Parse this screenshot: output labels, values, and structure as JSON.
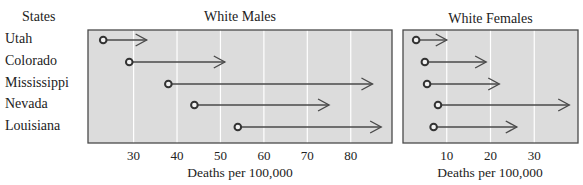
{
  "states_header": "States",
  "states": [
    "Utah",
    "Colorado",
    "Mississippi",
    "Nevada",
    "Louisiana"
  ],
  "colors": {
    "panel_fill": "#dcdcdc",
    "panel_border": "#4a4a4a",
    "gridline": "#ffffff",
    "arrow": "#4a4a4a",
    "marker": "#333333"
  },
  "chart_data": [
    {
      "type": "arrow-dot",
      "title": "White Males",
      "xlabel": "Deaths per 100,000",
      "ylabel": "States",
      "xticks": [
        30,
        40,
        50,
        60,
        70,
        80
      ],
      "xlim": [
        19.5,
        89.5
      ],
      "grid": true,
      "categories": [
        "Utah",
        "Colorado",
        "Mississippi",
        "Nevada",
        "Louisiana"
      ],
      "series": [
        {
          "name": "start",
          "values": [
            23,
            29,
            38,
            44,
            54
          ]
        },
        {
          "name": "end",
          "values": [
            33,
            51,
            85,
            75,
            87
          ]
        }
      ]
    },
    {
      "type": "arrow-dot",
      "title": "White Females",
      "xlabel": "Deaths per 100,000",
      "ylabel": "States",
      "xticks": [
        10,
        20,
        30
      ],
      "xlim": [
        0,
        40
      ],
      "grid": true,
      "categories": [
        "Utah",
        "Colorado",
        "Mississippi",
        "Nevada",
        "Louisiana"
      ],
      "series": [
        {
          "name": "start",
          "values": [
            3,
            5,
            5.5,
            8,
            7
          ]
        },
        {
          "name": "end",
          "values": [
            10,
            19,
            22,
            38,
            26
          ]
        }
      ]
    }
  ]
}
